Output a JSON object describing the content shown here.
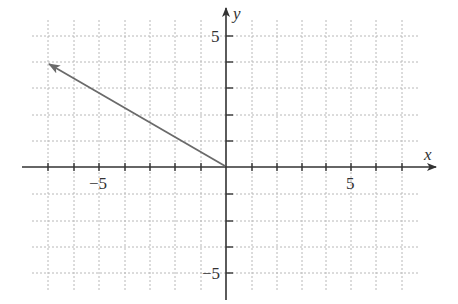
{
  "diagram": {
    "type": "coordinate-plane-vector",
    "x_axis_label": "x",
    "y_axis_label": "y",
    "x_tick_labels": [
      {
        "value": -5,
        "text": "−5"
      },
      {
        "value": 5,
        "text": "5"
      }
    ],
    "y_tick_labels": [
      {
        "value": 5,
        "text": "5"
      },
      {
        "value": -5,
        "text": "−5"
      }
    ],
    "grid": "dashed unit grid",
    "vector": {
      "tail": [
        0,
        0
      ],
      "head": [
        -7,
        4
      ],
      "color": "#6a6a6a"
    },
    "axis_color": "#333333",
    "grid_color": "#b8b8b8"
  }
}
